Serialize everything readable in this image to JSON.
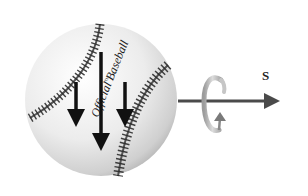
{
  "diagram": {
    "subject": "baseball",
    "ball_text": "Official Baseball",
    "ball_mark": "TM",
    "axis_label": "S",
    "colors": {
      "background": "#ffffff",
      "ball_light": "#f4f4f4",
      "ball_shadow": "#9a9a9a",
      "stitch": "#3a3a3a",
      "force_arrow": "#111111",
      "axis_arrow": "#4a4a4a",
      "spin_ring": "#b8b8b8"
    },
    "force_arrows": [
      {
        "name": "left",
        "length": "short"
      },
      {
        "name": "center",
        "length": "long"
      },
      {
        "name": "right",
        "length": "short"
      }
    ],
    "spin_indicator": "rotation-arrow"
  }
}
